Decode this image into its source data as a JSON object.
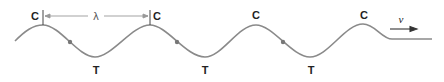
{
  "diagram": {
    "type": "transverse-wave",
    "crest_label": "C",
    "trough_label": "T",
    "wavelength_symbol": "λ",
    "velocity_symbol": "v",
    "labels": {
      "crests": [
        "C",
        "C",
        "C",
        "C"
      ],
      "troughs": [
        "T",
        "T",
        "T"
      ]
    },
    "colors": {
      "wave": "#8a8a8a",
      "dots": "#777777",
      "text": "#222222",
      "dimension_line": "#999999"
    }
  }
}
